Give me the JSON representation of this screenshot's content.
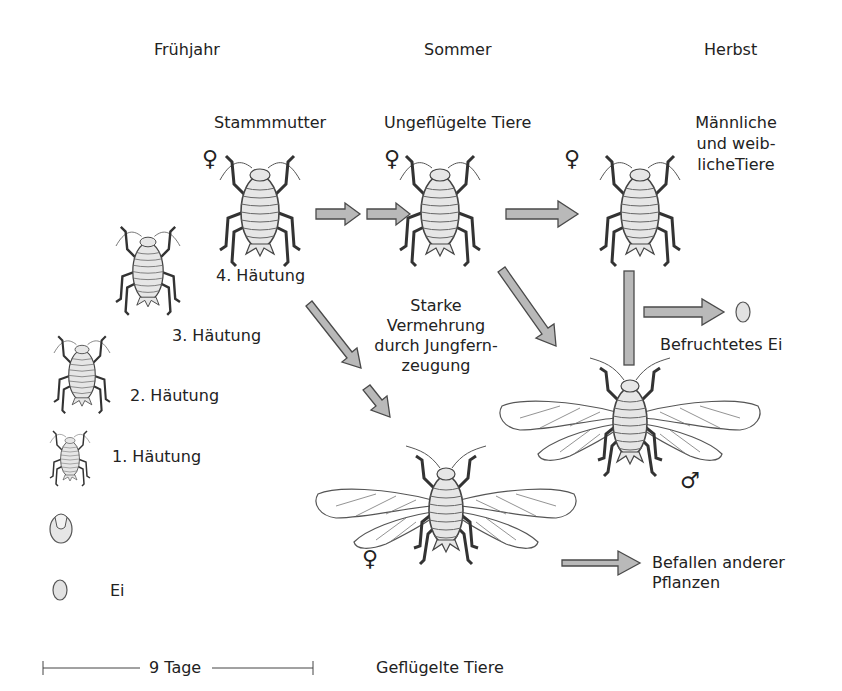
{
  "seasons": {
    "spring": "Frühjahr",
    "summer": "Sommer",
    "autumn": "Herbst"
  },
  "stages": {
    "stem_mother": "Stammmutter",
    "wingless": "Ungeflügelte Tiere",
    "sexual": "Männliche\nund weib-\nlicheTiere",
    "molt4": "4. Häutung",
    "molt3": "3. Häutung",
    "molt2": "2. Häutung",
    "molt1": "1. Häutung",
    "egg": "Ei",
    "fertilized_egg": "Befruchtetes Ei",
    "reproduction": "Starke\nVermehrung\ndurch Jungfern-\nzeugung",
    "infest": "Befallen anderer\nPflanzen",
    "winged": "Geflügelte Tiere"
  },
  "scale": {
    "label": "9 Tage"
  },
  "symbols": {
    "female": "♀",
    "male": "♂"
  },
  "colors": {
    "arrow_fill": "#b9b9b9",
    "arrow_stroke": "#4a4a4a",
    "line": "#3a3a3a",
    "body_fill": "#e6e6e6"
  }
}
